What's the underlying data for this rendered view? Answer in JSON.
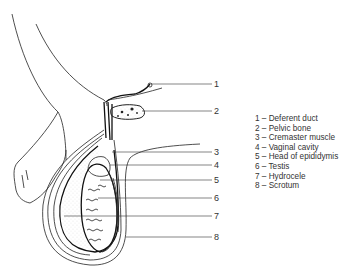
{
  "diagram": {
    "title": "",
    "callouts": [
      {
        "number": "1",
        "label": "Deferent duct"
      },
      {
        "number": "2",
        "label": "Pelvic bone"
      },
      {
        "number": "3",
        "label": "Cremaster muscle"
      },
      {
        "number": "4",
        "label": "Vaginal cavity"
      },
      {
        "number": "5",
        "label": "Head of epididymis"
      },
      {
        "number": "6",
        "label": "Testis"
      },
      {
        "number": "7",
        "label": "Hydrocele"
      },
      {
        "number": "8",
        "label": "Scrotum"
      }
    ],
    "legend": [
      "1 – Deferent duct",
      "2 – Pelvic bone",
      "3 – Cremaster muscle",
      "4 – Vaginal cavity",
      "5 – Head of epididymis",
      "6 – Testis",
      "7 – Hydrocele",
      "8 – Scrotum"
    ]
  }
}
